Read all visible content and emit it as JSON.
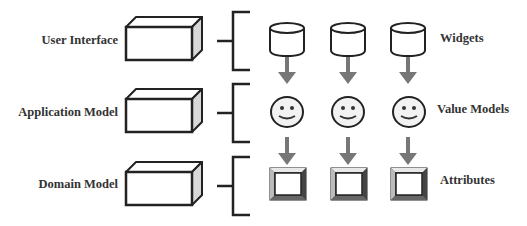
{
  "layers": [
    {
      "label": "User Interface",
      "element_label": "Widgets",
      "element_icon": "cylinder-icon"
    },
    {
      "label": "Application Model",
      "element_label": "Value Models",
      "element_icon": "smiley-face-icon"
    },
    {
      "label": "Domain Model",
      "element_label": "Attributes",
      "element_icon": "beveled-square-icon"
    }
  ],
  "colors": {
    "stroke": "#222222",
    "arrow": "#777777",
    "box_side": "#d8d8d8",
    "face_fill": "#f2f2f2",
    "text": "#333333"
  }
}
